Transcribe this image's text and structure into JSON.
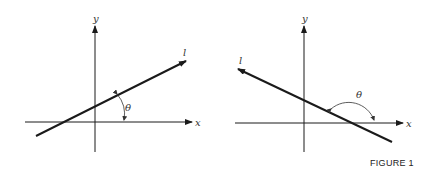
{
  "figure": {
    "caption": "FIGURE 1",
    "panels": [
      {
        "id": "positive-slope",
        "x_label": "x",
        "y_label": "y",
        "line_label": "l",
        "angle_label": "θ",
        "description": "Line l with positive slope; angle θ measured from x-axis to l (acute)"
      },
      {
        "id": "negative-slope",
        "x_label": "x",
        "y_label": "y",
        "line_label": "l",
        "angle_label": "θ",
        "description": "Line l with negative slope; angle θ measured from x-axis to l (obtuse)"
      }
    ]
  },
  "colors": {
    "ink": "#1a1a1a",
    "background": "#ffffff"
  }
}
